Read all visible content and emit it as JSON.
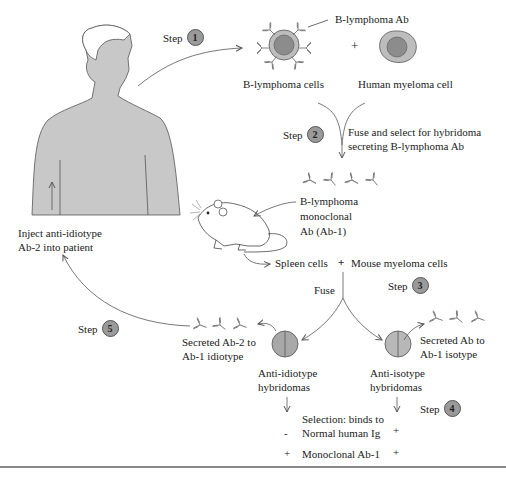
{
  "figure": {
    "steps": [
      {
        "label": "Step",
        "number": "1"
      },
      {
        "label": "Step",
        "number": "2"
      },
      {
        "label": "Step",
        "number": "3"
      },
      {
        "label": "Step",
        "number": "4"
      },
      {
        "label": "Step",
        "number": "5"
      }
    ],
    "top": {
      "b_lymphoma_ab": "B-lymphoma Ab",
      "plus": "+",
      "b_lymphoma_cells": "B-lymphoma cells",
      "human_myeloma_cell": "Human myeloma cell"
    },
    "fuse_select": {
      "line1": "Fuse and select for hybridoma",
      "line2": "secreting B-lymphoma Ab"
    },
    "monoclonal": {
      "line1": "B-lymphoma",
      "line2": "monoclonal",
      "line3": "Ab (Ab-1)"
    },
    "spleen_row": {
      "spleen": "Spleen cells",
      "plus": "+",
      "mouse_myeloma": "Mouse myeloma cells"
    },
    "fuse_label": "Fuse",
    "patient": {
      "line1": "Inject anti-idiotype",
      "line2": "Ab-2 into patient"
    },
    "left_branch": {
      "secreted_line1": "Secreted Ab-2 to",
      "secreted_line2": "Ab-1 idiotype",
      "hybridoma_line1": "Anti-idiotype",
      "hybridoma_line2": "hybridomas"
    },
    "right_branch": {
      "secreted_line1": "Secreted Ab to",
      "secreted_line2": "Ab-1 isotype",
      "hybridoma_line1": "Anti-isotype",
      "hybridoma_line2": "hybridomas"
    },
    "selection": {
      "line1": "Selection: binds to",
      "row1_label": "Normal human Ig",
      "row1_left": "-",
      "row1_right": "+",
      "row2_label": "Monoclonal Ab-1",
      "row2_left": "+",
      "row2_right": "+"
    }
  },
  "colors": {
    "skin": "#c8c8c8",
    "cell_outer": "#bdbdbd",
    "cell_inner": "#8c8c8c",
    "badge": "#9a9a9a",
    "line": "#444444"
  }
}
